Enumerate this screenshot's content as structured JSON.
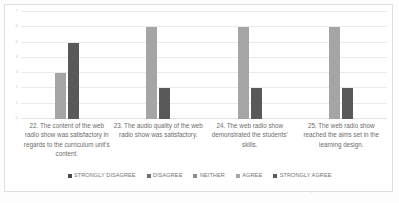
{
  "chart_data": {
    "type": "bar",
    "title": "",
    "xlabel": "",
    "ylabel": "",
    "ylim": [
      0,
      7
    ],
    "grid": true,
    "legend_position": "bottom",
    "yticks": [
      "0",
      "1",
      "2",
      "3",
      "4",
      "5",
      "6",
      "7"
    ],
    "categories": [
      "22. The content of the web radio show was satisfactory in regards to the curriculum unit's content.",
      "23. The audio quality of the web radio show was satisfactory.",
      "24. The web radio show demonstrated the students' skills.",
      "25. The web radio show reached the aims set in the learning design."
    ],
    "series": [
      {
        "name": "STRONGLY DISAGREE",
        "color": "#4A4A4A",
        "values": [
          0,
          0,
          0,
          0
        ]
      },
      {
        "name": "DISAGREE",
        "color": "#6E6E6E",
        "values": [
          0,
          0,
          0,
          0
        ]
      },
      {
        "name": "NEITHER",
        "color": "#8C8C8C",
        "values": [
          0,
          0,
          0,
          0
        ]
      },
      {
        "name": "AGREE",
        "color": "#A5A5A5",
        "values": [
          3,
          6,
          6,
          6
        ]
      },
      {
        "name": "STRONGLY AGREE",
        "color": "#595959",
        "values": [
          5,
          2,
          2,
          2
        ]
      }
    ]
  }
}
